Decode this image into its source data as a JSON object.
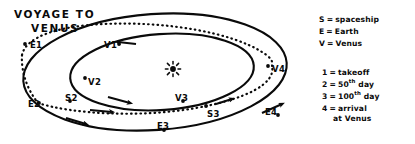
{
  "title": {
    "line1": "VOYAGE TO",
    "line2": "VENUS"
  },
  "sun": {
    "icon": "sun-starburst-icon"
  },
  "orbit_points": [
    {
      "id": "E1",
      "label": "E1",
      "x": 30,
      "y": 41,
      "dot_x": 25,
      "dot_y": 44
    },
    {
      "id": "E2",
      "label": "E2",
      "x": 28,
      "y": 100,
      "dot_x": 39,
      "dot_y": 103
    },
    {
      "id": "E3",
      "label": "E3",
      "x": 157,
      "y": 122,
      "dot_x": 164,
      "dot_y": 130
    },
    {
      "id": "E4",
      "label": "E4",
      "x": 265,
      "y": 108,
      "dot_x": 278,
      "dot_y": 115
    },
    {
      "id": "V1",
      "label": "V1",
      "x": 104,
      "y": 41,
      "dot_x": 119,
      "dot_y": 44
    },
    {
      "id": "V2",
      "label": "V2",
      "x": 88,
      "y": 78,
      "dot_x": 85,
      "dot_y": 78
    },
    {
      "id": "V3",
      "label": "V3",
      "x": 175,
      "y": 94,
      "dot_x": 183,
      "dot_y": 101
    },
    {
      "id": "V4",
      "label": "V4",
      "x": 272,
      "y": 65,
      "dot_x": 268,
      "dot_y": 66
    },
    {
      "id": "S2",
      "label": "S2",
      "x": 65,
      "y": 94,
      "dot_x": 70,
      "dot_y": 101
    },
    {
      "id": "S3",
      "label": "S3",
      "x": 207,
      "y": 110,
      "dot_x": 206,
      "dot_y": 106
    }
  ],
  "legend": {
    "key_entries": [
      {
        "symbol": "S",
        "eq": "=",
        "text": "spaceship"
      },
      {
        "symbol": "E",
        "eq": "=",
        "text": "Earth"
      },
      {
        "symbol": "V",
        "eq": "=",
        "text": "Venus"
      }
    ],
    "numbered_entries": [
      {
        "num": "1",
        "eq": "=",
        "text": "takeoff",
        "sup": "",
        "suffix": ""
      },
      {
        "num": "2",
        "eq": "=",
        "text": "50",
        "sup": "th",
        "suffix": " day"
      },
      {
        "num": "3",
        "eq": "=",
        "text": "100",
        "sup": "th",
        "suffix": " day"
      },
      {
        "num": "4",
        "eq": "=",
        "text": "arrival",
        "sup": "",
        "suffix": "",
        "second_line": "at Venus"
      }
    ]
  },
  "colors": {
    "ink": "#0a0a0a",
    "paper": "#ffffff"
  }
}
